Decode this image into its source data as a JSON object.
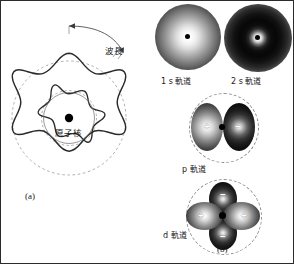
{
  "figure": {
    "panel_a": {
      "caption": "(a)",
      "nucleus_label": "原子核",
      "wavelength_label": "波長",
      "description": "standing-wave (de Broglie) electron wave around the atomic nucleus, six wavelengths on the orbit"
    },
    "panel_b": {
      "caption": "(b)",
      "orbitals": [
        {
          "id": "orbital-1s",
          "label": "1 s 軌道",
          "type": "s",
          "signs": [],
          "shading": "bright-core-to-dark-rim"
        },
        {
          "id": "orbital-2s",
          "label": "2 s 軌道",
          "type": "s",
          "signs": [],
          "shading": "bright-core, dark shell, fading halo"
        },
        {
          "id": "orbital-p",
          "label": "p 軌道",
          "type": "p",
          "signs": [
            "+",
            "−"
          ],
          "lobes": 2,
          "shading": "two lobes, left light (+), right dark (−)"
        },
        {
          "id": "orbital-d",
          "label": "d 軌道",
          "type": "d",
          "signs": [
            "−",
            "+",
            "+",
            "−"
          ],
          "lobes": 4,
          "shading": "four lobes, horizontal (+) light, vertical (−) dark"
        }
      ]
    }
  },
  "colors": {
    "border": "#2b2b2b",
    "wave_stroke": "#2a2a2a",
    "guide_dashed": "#9a9a9a",
    "nucleus": "#000000",
    "text": "#1a1a1a",
    "background": "#ffffff"
  }
}
